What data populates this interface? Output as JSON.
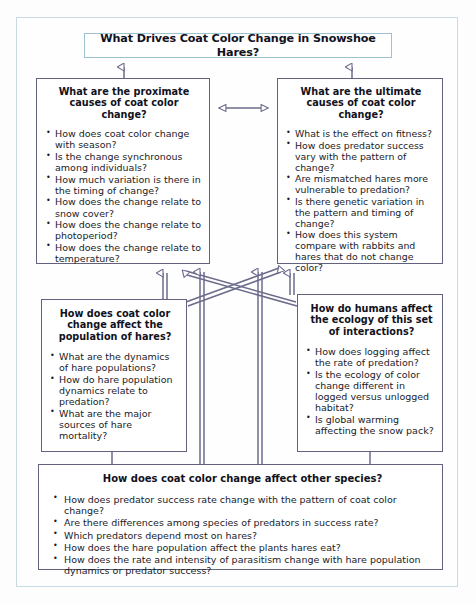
{
  "diagram": {
    "title_banner": {
      "text": "What Drives Coat Color Change in Snowshoe Hares?"
    },
    "nodes": {
      "proximate": {
        "title": "What are the proximate causes of coat color change?",
        "bullets": [
          "How does coat color change with season?",
          "Is the change synchronous among individuals?",
          "How much variation is there in the timing of change?",
          "How does the change relate to snow cover?",
          "How does the change relate to photoperiod?",
          "How does the change relate to temperature?"
        ]
      },
      "ultimate": {
        "title": "What are the ultimate causes of coat color change?",
        "bullets": [
          "What is the effect on fitness?",
          "How does predator success vary with the pattern of change?",
          "Are mismatched hares more vulnerable to predation?",
          "Is there genetic variation in the pattern and timing of change?",
          "How does this system compare with rabbits and hares that do not change color?"
        ]
      },
      "population": {
        "title": "How does coat color change affect the population of hares?",
        "bullets": [
          "What are the dynamics of hare populations?",
          "How do hare population dynamics relate to predation?",
          "What are the major sources of hare mortality?"
        ]
      },
      "humans": {
        "title": "How do humans affect the ecology of this set of interactions?",
        "bullets": [
          "How does logging affect the rate of predation?",
          "Is the ecology of color change different in logged versus unlogged habitat?",
          "Is global warming affecting the snow pack?"
        ]
      },
      "other_species": {
        "title": "How does coat color change affect other species?",
        "bullets": [
          "How does predator success rate change with the pattern of coat color change?",
          "Are there differences among species of predators in success rate?",
          "Which predators depend most on hares?",
          "How does the hare population affect the plants hares eat?",
          "How does the rate and intensity of parasitism change with hare population dynamics or predator success?"
        ]
      }
    },
    "colors": {
      "box_border": "#62627f",
      "banner_border": "#9dc2d4",
      "frame_border": "#c9dbe4",
      "connector": "#6b6b8c",
      "background": "#fefefe",
      "text": "#1b1b28"
    }
  }
}
